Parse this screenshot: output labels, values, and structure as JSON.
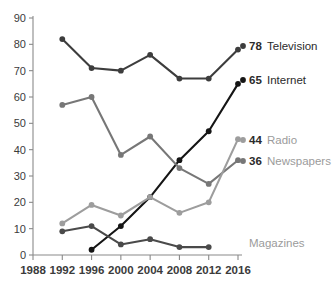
{
  "chart_data": {
    "type": "line",
    "title": "",
    "xlabel": "",
    "ylabel": "",
    "x": [
      1988,
      1992,
      1996,
      2000,
      2004,
      2008,
      2012,
      2016
    ],
    "xtick_labels": [
      "1988",
      "1992",
      "1996",
      "2000",
      "2004",
      "2008",
      "2012",
      "2016"
    ],
    "ytick_labels": [
      "0",
      "10",
      "20",
      "30",
      "40",
      "50",
      "60",
      "70",
      "80",
      "90"
    ],
    "yticks": [
      0,
      10,
      20,
      30,
      40,
      50,
      60,
      70,
      80,
      90
    ],
    "ylim": [
      0,
      90
    ],
    "xlim": [
      1988,
      2016
    ],
    "grid": false,
    "legend_position": "right-inline-end-labels",
    "series": [
      {
        "name": "Television",
        "color": "#3d3d3d",
        "label_value": "78",
        "label_name": "Television",
        "label_name_dark": true,
        "x": [
          1992,
          1996,
          2000,
          2004,
          2008,
          2012,
          2016
        ],
        "values": [
          82,
          71,
          70,
          76,
          67,
          67,
          78
        ]
      },
      {
        "name": "Internet",
        "color": "#151515",
        "label_value": "65",
        "label_name": "Internet",
        "label_name_dark": true,
        "x": [
          1996,
          2000,
          2004,
          2008,
          2012,
          2016
        ],
        "values": [
          2,
          11,
          22,
          36,
          47,
          65
        ]
      },
      {
        "name": "Newspapers",
        "color": "#777777",
        "label_value": "36",
        "label_name": "Newspapers",
        "label_name_dark": false,
        "x": [
          1992,
          1996,
          2000,
          2004,
          2008,
          2012,
          2016
        ],
        "values": [
          57,
          60,
          38,
          45,
          33,
          27,
          36
        ]
      },
      {
        "name": "Radio",
        "color": "#9d9d9d",
        "label_value": "44",
        "label_name": "Radio",
        "label_name_dark": false,
        "x": [
          1992,
          1996,
          2000,
          2004,
          2008,
          2012,
          2016
        ],
        "values": [
          12,
          19,
          15,
          22,
          16,
          20,
          44
        ]
      },
      {
        "name": "Magazines",
        "color": "#4a4a4a",
        "label_value": "",
        "label_name": "Magazines",
        "label_name_dark": false,
        "x": [
          1992,
          1996,
          2000,
          2004,
          2008,
          2012
        ],
        "values": [
          9,
          11,
          4,
          6,
          3,
          3
        ]
      }
    ]
  },
  "axis": {
    "y_title": "",
    "x_title": ""
  }
}
